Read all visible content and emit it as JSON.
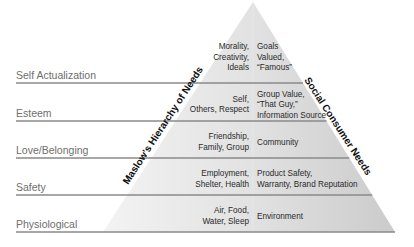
{
  "diagram": {
    "type": "pyramid",
    "left_axis_title": "Maslow's Hierarchy of Needs",
    "right_axis_title": "Social Consumer Needs",
    "levels": [
      {
        "name": "Self Actualization",
        "maslow": [
          "Morality,",
          "Creativity,",
          "Ideals"
        ],
        "social": [
          "Goals",
          "Valued,",
          "“Famous”"
        ]
      },
      {
        "name": "Esteem",
        "maslow": [
          "Self,",
          "Others, Respect"
        ],
        "social": [
          "Group Value,",
          "“That Guy,”",
          "Information Source"
        ]
      },
      {
        "name": "Love/Belonging",
        "maslow": [
          "Friendship,",
          "Family, Group"
        ],
        "social": [
          "Community"
        ]
      },
      {
        "name": "Safety",
        "maslow": [
          "Employment,",
          "Shelter, Health"
        ],
        "social": [
          "Product Safety,",
          "Warranty, Brand Reputation"
        ]
      },
      {
        "name": "Physiological",
        "maslow": [
          "Air, Food,",
          "Water, Sleep"
        ],
        "social": [
          "Environment"
        ]
      }
    ],
    "colors": {
      "pyramid_fill_left": "#e9e9e9",
      "pyramid_fill_right": "#c9c9c9",
      "divider_line": "#8a8a8a",
      "level_label": "#6e6e6e"
    }
  }
}
